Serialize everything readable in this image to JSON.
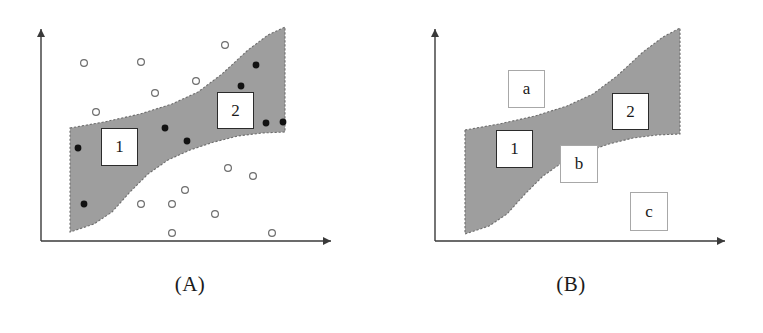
{
  "figure": {
    "title": "",
    "panels": [
      {
        "id": "A",
        "caption": "(A)",
        "axes": {
          "x_axis_label": "",
          "y_axis_label": "",
          "origin": [
            41,
            241
          ],
          "x_axis_end": [
            336,
            241
          ],
          "y_axis_end": [
            41,
            25
          ],
          "arrowheads": true,
          "ticks": false,
          "grid": false
        },
        "band": {
          "name": "shaded-confidence-band",
          "fill_color": "#9e9e9e",
          "border_style": "dashed",
          "border_color": "#6e6e6e",
          "upper_boundary": [
            [
              70,
              128
            ],
            [
              104,
              122
            ],
            [
              140,
              114
            ],
            [
              172,
              104
            ],
            [
              198,
              92
            ],
            [
              222,
              74
            ],
            [
              248,
              50
            ],
            [
              268,
              35
            ],
            [
              285,
              27
            ]
          ],
          "lower_boundary": [
            [
              285,
              132
            ],
            [
              262,
              133
            ],
            [
              238,
              136
            ],
            [
              214,
              142
            ],
            [
              190,
              150
            ],
            [
              168,
              160
            ],
            [
              148,
              174
            ],
            [
              130,
              192
            ],
            [
              112,
              212
            ],
            [
              94,
              224
            ],
            [
              70,
              232
            ]
          ]
        },
        "labels": [
          {
            "text": "1",
            "name": "region-label-1",
            "x": 101,
            "y": 128,
            "w": 37,
            "h": 38,
            "style": "strong"
          },
          {
            "text": "2",
            "name": "region-label-2",
            "x": 217,
            "y": 92,
            "w": 37,
            "h": 37,
            "style": "strong"
          }
        ],
        "filled_points": {
          "name": "inlier-points",
          "marker": "filled-circle",
          "color": "#121212",
          "radius": 3.4,
          "coords": [
            [
              78,
              148
            ],
            [
              165,
              128
            ],
            [
              187,
              141
            ],
            [
              84,
              204
            ],
            [
              256,
              65
            ],
            [
              241,
              86
            ],
            [
              266,
              123
            ],
            [
              283,
              122
            ]
          ]
        },
        "open_points": {
          "name": "outlier-points",
          "marker": "open-circle",
          "color": "#6d6d6d",
          "radius": 3.4,
          "coords": [
            [
              84,
              63
            ],
            [
              141,
              62
            ],
            [
              225,
              45
            ],
            [
              196,
              81
            ],
            [
              155,
              93
            ],
            [
              96,
              112
            ],
            [
              228,
              168
            ],
            [
              253,
              176
            ],
            [
              185,
              190
            ],
            [
              141,
              204
            ],
            [
              172,
              204
            ],
            [
              215,
              214
            ],
            [
              172,
              233
            ],
            [
              272,
              233
            ]
          ]
        }
      },
      {
        "id": "B",
        "caption": "(B)",
        "axes": {
          "x_axis_label": "",
          "y_axis_label": "",
          "origin": [
            54,
            241
          ],
          "x_axis_end": [
            349,
            241
          ],
          "y_axis_end": [
            54,
            25
          ],
          "arrowheads": true,
          "ticks": false,
          "grid": false
        },
        "band": {
          "name": "shaded-confidence-band",
          "fill_color": "#9e9e9e",
          "border_style": "dashed",
          "border_color": "#6e6e6e",
          "upper_boundary": [
            [
              84,
              130
            ],
            [
              118,
              124
            ],
            [
              154,
              116
            ],
            [
              186,
              106
            ],
            [
              212,
              94
            ],
            [
              236,
              76
            ],
            [
              262,
              52
            ],
            [
              282,
              37
            ],
            [
              299,
              28
            ]
          ],
          "lower_boundary": [
            [
              299,
              134
            ],
            [
              276,
              135
            ],
            [
              252,
              138
            ],
            [
              228,
              144
            ],
            [
              204,
              152
            ],
            [
              182,
              162
            ],
            [
              162,
              176
            ],
            [
              144,
              194
            ],
            [
              126,
              214
            ],
            [
              108,
              226
            ],
            [
              84,
              234
            ]
          ]
        },
        "labels": [
          {
            "text": "1",
            "name": "region-label-1",
            "x": 115,
            "y": 130,
            "w": 37,
            "h": 38,
            "style": "strong"
          },
          {
            "text": "2",
            "name": "region-label-2",
            "x": 231,
            "y": 93,
            "w": 37,
            "h": 37,
            "style": "strong"
          },
          {
            "text": "a",
            "name": "region-label-a",
            "x": 127,
            "y": 70,
            "w": 37,
            "h": 38,
            "style": "light"
          },
          {
            "text": "b",
            "name": "region-label-b",
            "x": 179,
            "y": 145,
            "w": 38,
            "h": 38,
            "style": "light"
          },
          {
            "text": "c",
            "name": "region-label-c",
            "x": 249,
            "y": 192,
            "w": 38,
            "h": 39,
            "style": "light"
          }
        ],
        "filled_points": {
          "name": "inlier-points",
          "marker": "filled-circle",
          "color": "#121212",
          "radius": 3.4,
          "coords": []
        },
        "open_points": {
          "name": "outlier-points",
          "marker": "open-circle",
          "color": "#6d6d6d",
          "radius": 3.4,
          "coords": []
        }
      }
    ]
  }
}
